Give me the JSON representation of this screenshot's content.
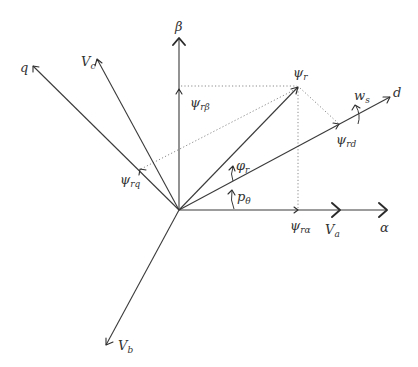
{
  "diagram": {
    "type": "vector-diagram",
    "colors": {
      "line": "#3a3a3a",
      "dotted": "#8a8a8a",
      "text": "#333333",
      "background": "#ffffff"
    },
    "labels": {
      "beta": {
        "main": "β",
        "sub": ""
      },
      "alpha": {
        "main": "α",
        "sub": ""
      },
      "q": {
        "main": "q",
        "sub": ""
      },
      "d": {
        "main": "d",
        "sub": ""
      },
      "vc": {
        "main": "V",
        "sub": "c"
      },
      "va": {
        "main": "V",
        "sub": "a"
      },
      "vb": {
        "main": "V",
        "sub": "b"
      },
      "psi_r": {
        "main": "ψ",
        "sub": "r"
      },
      "psi_rbeta": {
        "main": "ψ",
        "sub": "rβ"
      },
      "psi_ralpha": {
        "main": "ψ",
        "sub": "rα"
      },
      "psi_rd": {
        "main": "ψ",
        "sub": "rd"
      },
      "psi_rq": {
        "main": "ψ",
        "sub": "rq"
      },
      "phi_r": {
        "main": "φ",
        "sub": "r"
      },
      "p_theta": {
        "main": "p",
        "sub": "θ"
      },
      "w_s": {
        "main": "w",
        "sub": "s"
      }
    },
    "nodes": [
      "origin",
      "beta-axis",
      "alpha-axis",
      "d-axis",
      "q-axis",
      "Vc-axis",
      "Va-marker",
      "Vb-axis",
      "psi_r-vector",
      "psi_ralpha-projection",
      "psi_rbeta-projection",
      "psi_rd-projection",
      "psi_rq-projection",
      "phi_r-angle",
      "p_theta-angle",
      "w_s-rotation"
    ],
    "edges": [
      {
        "from": "origin",
        "to": "beta-axis",
        "style": "solid-arrow"
      },
      {
        "from": "origin",
        "to": "alpha-axis",
        "style": "solid-arrow"
      },
      {
        "from": "origin",
        "to": "d-axis",
        "style": "solid-arrow"
      },
      {
        "from": "origin",
        "to": "q-axis",
        "style": "solid-arrow"
      },
      {
        "from": "origin",
        "to": "Vc-axis",
        "style": "solid-arrow"
      },
      {
        "from": "origin",
        "to": "Vb-axis",
        "style": "solid-arrow"
      },
      {
        "from": "origin",
        "to": "psi_r-vector",
        "style": "solid-arrow"
      },
      {
        "from": "psi_r-vector",
        "to": "psi_ralpha-projection",
        "style": "dotted"
      },
      {
        "from": "psi_r-vector",
        "to": "psi_rbeta-projection",
        "style": "dotted"
      },
      {
        "from": "psi_r-vector",
        "to": "psi_rd-projection",
        "style": "dotted"
      },
      {
        "from": "psi_r-vector",
        "to": "psi_rq-projection",
        "style": "dotted"
      }
    ]
  }
}
